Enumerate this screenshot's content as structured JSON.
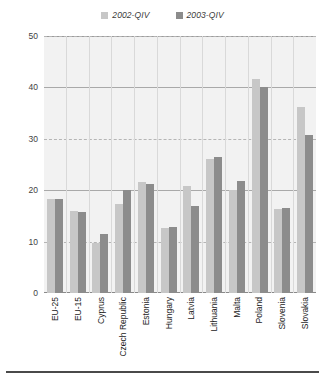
{
  "chart_data": {
    "type": "bar",
    "title": "",
    "subtitle": "",
    "xlabel": "",
    "ylabel": "",
    "ylim": [
      0,
      50
    ],
    "yticks": [
      0,
      10,
      20,
      30,
      40,
      50
    ],
    "grid": true,
    "legend_position": "top-center",
    "categories": [
      "EU-25",
      "EU-15",
      "Cyprus",
      "Czech Republic",
      "Estonia",
      "Hungary",
      "Latvia",
      "Lithuania",
      "Malta",
      "Poland",
      "Slovenia",
      "Slovakia"
    ],
    "series": [
      {
        "name": "2002-QIV",
        "color": "#c7c7c7",
        "values": [
          18.2,
          16.0,
          9.8,
          17.3,
          21.6,
          12.7,
          20.9,
          26.0,
          20.0,
          41.7,
          16.4,
          36.1
        ]
      },
      {
        "name": "2003-QIV",
        "color": "#8c8c8c",
        "values": [
          18.3,
          15.8,
          11.5,
          20.0,
          21.3,
          12.8,
          17.0,
          26.4,
          21.7,
          40.0,
          16.5,
          30.7
        ]
      }
    ]
  },
  "legend": {
    "entries": [
      {
        "label": "2002-QIV",
        "color": "#c7c7c7"
      },
      {
        "label": "2003-QIV",
        "color": "#8c8c8c"
      }
    ]
  },
  "axis": {
    "y_tick_labels": [
      "50",
      "40",
      "30",
      "20",
      "10",
      "0"
    ]
  }
}
